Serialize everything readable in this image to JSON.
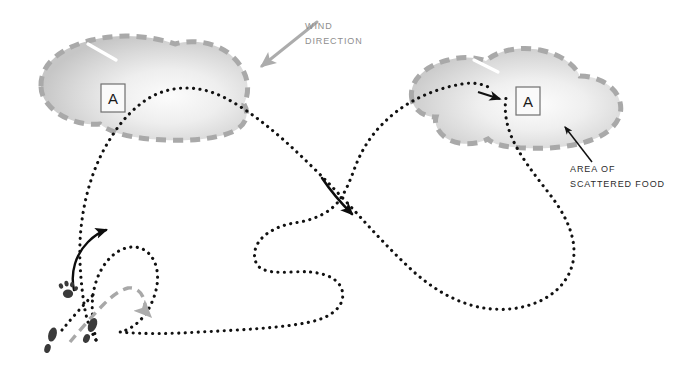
{
  "figure": {
    "kind": "scent-tracking-diagram",
    "background_color": "#ffffff"
  },
  "labels": {
    "wind": {
      "line1": "WIND",
      "line2": "DIRECTION",
      "color": "#8e8e8e"
    },
    "food": {
      "line1": "AREA OF",
      "line2": "SCATTERED FOOD",
      "color": "#2c2c2c"
    },
    "zone_left": {
      "text": "A"
    },
    "zone_right": {
      "text": "A"
    }
  },
  "colors": {
    "scent_cloud_outline": "#a9a9a9",
    "scent_cloud_fill_edge": "#c8c8c8",
    "scent_cloud_fill_center": "#fbfbfb",
    "dog_track": "#111111",
    "handler_track": "#a8a8a8",
    "wind_arrow": "#acacac",
    "direction_arrow": "#0d0d0d",
    "paw_print": "#3a3a3a",
    "boot_print": "#3a3a3a",
    "label_box_stroke": "#6f6f6f"
  },
  "elements": {
    "scent_cone_left": {
      "name": "scent cone A (left)",
      "outline_style": "dashed",
      "fill_style": "radial-gradient"
    },
    "scent_cone_right": {
      "name": "scent cone A (right)",
      "outline_style": "dashed",
      "fill_style": "radial-gradient"
    },
    "dog_track_path": {
      "name": "dog search track",
      "style": "dotted"
    },
    "handler_track_path": {
      "name": "handler track",
      "style": "dashed"
    },
    "start_point": {
      "name": "start point"
    }
  }
}
